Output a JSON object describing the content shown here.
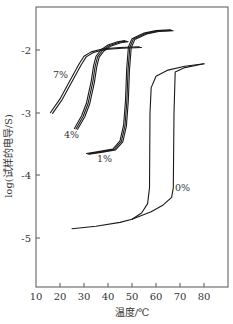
{
  "chart_data": {
    "type": "line",
    "title": "",
    "xlabel": "温度/℃",
    "ylabel": "log(试样的电导/S)",
    "xlim": [
      10,
      90
    ],
    "ylim": [
      -5.78,
      -1.31
    ],
    "xticks": [
      10,
      20,
      30,
      40,
      50,
      60,
      70,
      80
    ],
    "xtick_labels": [
      "10",
      "20",
      "30",
      "40",
      "50",
      "60",
      "70",
      "80"
    ],
    "yticks": [
      -2,
      -3,
      -4,
      -5
    ],
    "ytick_labels": [
      "-2",
      "-3",
      "-4",
      "-5"
    ],
    "grid": false,
    "legend": "inline labels",
    "series": [
      {
        "name": "7%",
        "description": "double trace, gradual rise",
        "x": [
          16,
          20,
          24,
          28,
          30,
          33,
          38,
          45,
          53
        ],
        "y": [
          -3.0,
          -2.78,
          -2.5,
          -2.22,
          -2.1,
          -2.03,
          -1.98,
          -1.96,
          -1.95
        ]
      },
      {
        "name": "4%",
        "description": "triple trace",
        "x": [
          26,
          29,
          31,
          33,
          34,
          35,
          37,
          40,
          44,
          47
        ],
        "y": [
          -3.25,
          -3.05,
          -2.85,
          -2.5,
          -2.25,
          -2.1,
          -2.0,
          -1.92,
          -1.87,
          -1.85
        ]
      },
      {
        "name": "1%",
        "description": "triple trace, steep transition near 47-48 ℃",
        "x": [
          31,
          36,
          42,
          45,
          46.5,
          47.3,
          47.8,
          48.5,
          50,
          55,
          60,
          66
        ],
        "y": [
          -3.65,
          -3.62,
          -3.58,
          -3.45,
          -3.2,
          -2.8,
          -2.3,
          -1.95,
          -1.82,
          -1.73,
          -1.69,
          -1.68
        ]
      },
      {
        "name": "0% (heating branch)",
        "description": "hysteresis, transition near 67.5 ℃",
        "x": [
          25,
          35,
          45,
          50,
          58,
          63,
          66.5,
          67.2,
          67.5,
          68,
          72,
          80
        ],
        "y": [
          -4.85,
          -4.81,
          -4.75,
          -4.7,
          -4.58,
          -4.47,
          -4.35,
          -4.2,
          -3.0,
          -2.35,
          -2.28,
          -2.22
        ]
      },
      {
        "name": "0% (cooling branch)",
        "description": "hysteresis, transition near 57.5 ℃",
        "x": [
          50,
          54,
          56.5,
          57.3,
          57.5,
          58,
          60,
          65,
          72,
          80
        ],
        "y": [
          -4.7,
          -4.6,
          -4.45,
          -4.2,
          -3.0,
          -2.6,
          -2.42,
          -2.32,
          -2.26,
          -2.22
        ]
      }
    ],
    "annotations": [
      {
        "text": "7%",
        "x": 23,
        "y": -2.45
      },
      {
        "text": "4%",
        "x": 24,
        "y": -3.38
      },
      {
        "text": "1%",
        "x": 37,
        "y": -3.75
      },
      {
        "text": "0%",
        "x": 71,
        "y": -4.2
      }
    ]
  }
}
